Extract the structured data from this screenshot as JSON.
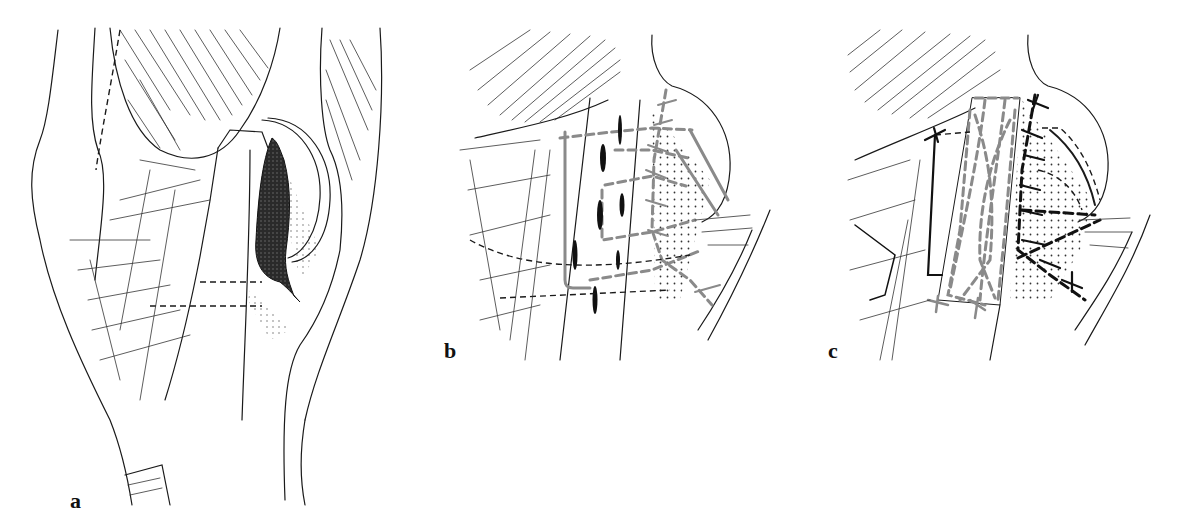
{
  "figure": {
    "panels": [
      {
        "id": "a",
        "label": "a",
        "description": "Lateral view of knee with tendon rupture (dark stippled defect) beside patella"
      },
      {
        "id": "b",
        "label": "b",
        "description": "Repair with dashed suture lines (grey) and cross-stitches across stippled region"
      },
      {
        "id": "c",
        "label": "c",
        "description": "Tendon flap (grey dashed outline) sutured over defect with black cross-stitches"
      }
    ],
    "colors": {
      "ink": "#1a1a1a",
      "suture_grey": "#8a8a8a",
      "background": "#ffffff",
      "defect": "#222222"
    }
  }
}
